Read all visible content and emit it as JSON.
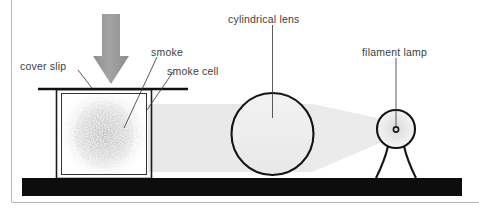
{
  "figure": {
    "background_color": "#ffffff",
    "frame_color": "#b9b9b9",
    "base_color": "#0d0d0d",
    "beam_color": "#e6e6e6",
    "arrow_color": "#9a9a9a",
    "outline_color": "#1a1a1a",
    "label_color": "#3d3d3d"
  },
  "labels": {
    "cover_slip": "cover  slip",
    "smoke": "smoke",
    "smoke_cell": "smoke cell",
    "cylindrical_lens": "cylindrical lens",
    "filament_lamp": "filament lamp"
  },
  "components": {
    "smoke_cell": {
      "name": "smoke cell",
      "shape": "rectangular box with double walls"
    },
    "cover_slip": {
      "name": "cover slip",
      "shape": "horizontal plate across top of cell"
    },
    "smoke": {
      "name": "smoke",
      "shape": "grey stipple cloud inside cell"
    },
    "arrow": {
      "name": "downward arrow",
      "direction": "down"
    },
    "cylindrical_lens": {
      "name": "cylindrical lens",
      "shape": "circle"
    },
    "filament_lamp": {
      "name": "filament lamp",
      "shape": "bulb with filament and neck"
    },
    "light_beam": {
      "name": "light beam",
      "shape": "converging cone from lamp through lens into cell"
    },
    "base": {
      "name": "bench base",
      "shape": "black horizontal bar"
    }
  }
}
